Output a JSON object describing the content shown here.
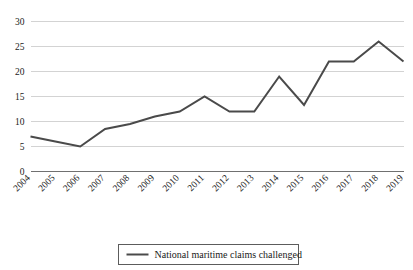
{
  "chart_data": {
    "type": "line",
    "title": "",
    "xlabel": "",
    "ylabel": "",
    "categories": [
      "2004",
      "2005",
      "2006",
      "2007",
      "2008",
      "2009",
      "2010",
      "2011",
      "2012",
      "2013",
      "2014",
      "2015",
      "2016",
      "2017",
      "2018",
      "2019"
    ],
    "series": [
      {
        "name": "National maritime claims challenged",
        "color": "#4a4a4a",
        "values": [
          7,
          6,
          5,
          8.5,
          9.5,
          11,
          12,
          15,
          12,
          12,
          19,
          13.3,
          22,
          22,
          26,
          22
        ]
      }
    ],
    "ylim": [
      0,
      30
    ],
    "ytick_values": [
      0,
      5,
      10,
      15,
      20,
      25,
      30
    ],
    "ytick_labels": [
      "0",
      "5",
      "10",
      "15",
      "20",
      "25",
      "30"
    ],
    "grid": true,
    "grid_color": "#c8c8c8",
    "legend": {
      "position": "bottom-center",
      "entries": [
        {
          "label": "National maritime claims challenged",
          "color": "#4a4a4a"
        }
      ]
    },
    "background_color": "#ffffff",
    "xtick_rotation": 45
  }
}
